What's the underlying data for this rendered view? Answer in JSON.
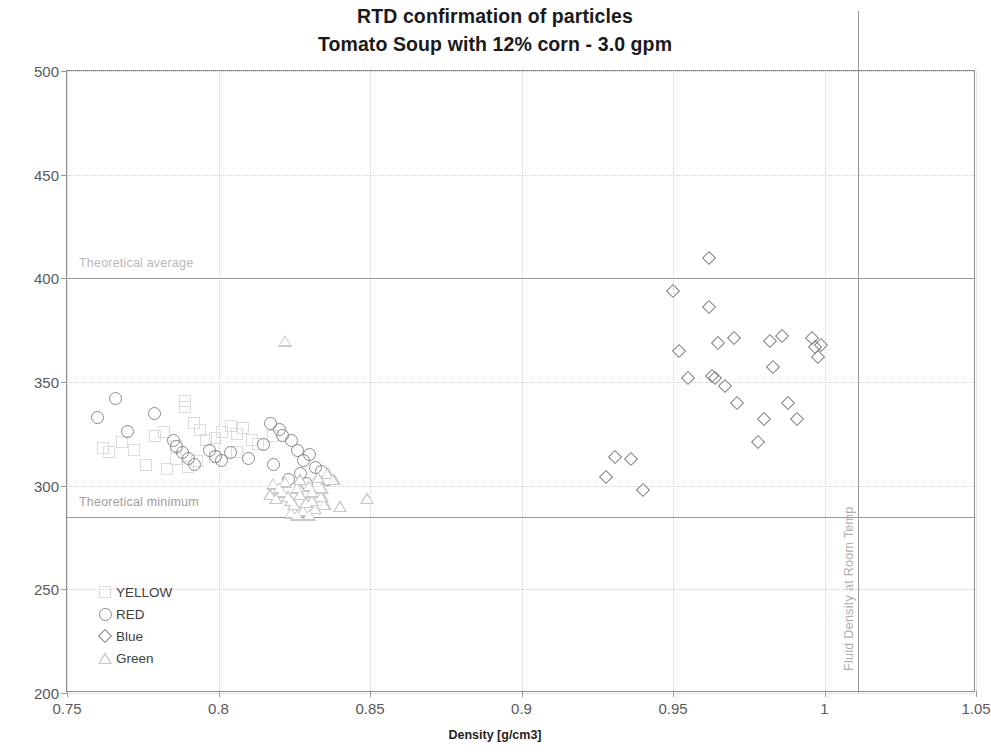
{
  "chart_data": {
    "type": "scatter",
    "title": "RTD confirmation of particles",
    "subtitle": "Tomato Soup with 12% corn -  3.0 gpm",
    "xlabel": "Density [g/cm3]",
    "ylabel": "Residence time in hold tube [s]",
    "xlim": [
      0.75,
      1.05
    ],
    "ylim": [
      200,
      500
    ],
    "xticks": [
      "0.75",
      "0.8",
      "0.85",
      "0.9",
      "0.95",
      "1",
      "1.05"
    ],
    "xtick_values": [
      0.75,
      0.8,
      0.85,
      0.9,
      0.95,
      1.0,
      1.05
    ],
    "yticks": [
      "200",
      "250",
      "300",
      "350",
      "400",
      "450",
      "500"
    ],
    "ytick_values": [
      200,
      250,
      300,
      350,
      400,
      450,
      500
    ],
    "grid": true,
    "legend_position": "lower-left inside plot",
    "annotations": [
      {
        "name": "theoretical-average",
        "text": "Theoretical average",
        "type": "hline",
        "y": 400
      },
      {
        "name": "theoretical-minimum",
        "text": "Theoretical minimum",
        "type": "hline",
        "y": 285
      },
      {
        "name": "fluid-density-room-temp",
        "text": "Fluid Density at Room Temp",
        "type": "vline",
        "x": 1.011
      }
    ],
    "series": [
      {
        "name": "YELLOW",
        "marker": "square",
        "color": "#dcdcdc",
        "points": [
          [
            0.762,
            318
          ],
          [
            0.764,
            316
          ],
          [
            0.768,
            321
          ],
          [
            0.772,
            317
          ],
          [
            0.779,
            324
          ],
          [
            0.782,
            326
          ],
          [
            0.786,
            319
          ],
          [
            0.789,
            341
          ],
          [
            0.789,
            338
          ],
          [
            0.792,
            330
          ],
          [
            0.794,
            327
          ],
          [
            0.796,
            322
          ],
          [
            0.799,
            323
          ],
          [
            0.801,
            326
          ],
          [
            0.804,
            329
          ],
          [
            0.806,
            325
          ],
          [
            0.808,
            328
          ],
          [
            0.811,
            322
          ],
          [
            0.786,
            313
          ],
          [
            0.793,
            312
          ],
          [
            0.799,
            314
          ],
          [
            0.806,
            316
          ],
          [
            0.813,
            320
          ],
          [
            0.818,
            324
          ],
          [
            0.776,
            310
          ],
          [
            0.783,
            308
          ],
          [
            0.79,
            309
          ]
        ]
      },
      {
        "name": "RED",
        "marker": "circle",
        "color": "#8a8a8a",
        "points": [
          [
            0.76,
            333
          ],
          [
            0.766,
            342
          ],
          [
            0.77,
            326
          ],
          [
            0.779,
            335
          ],
          [
            0.785,
            322
          ],
          [
            0.786,
            319
          ],
          [
            0.788,
            316
          ],
          [
            0.79,
            313
          ],
          [
            0.792,
            310
          ],
          [
            0.797,
            317
          ],
          [
            0.799,
            314
          ],
          [
            0.801,
            312
          ],
          [
            0.804,
            316
          ],
          [
            0.81,
            313
          ],
          [
            0.815,
            320
          ],
          [
            0.817,
            330
          ],
          [
            0.82,
            327
          ],
          [
            0.821,
            324
          ],
          [
            0.818,
            310
          ],
          [
            0.824,
            322
          ],
          [
            0.826,
            317
          ],
          [
            0.828,
            312
          ],
          [
            0.83,
            315
          ],
          [
            0.832,
            309
          ],
          [
            0.834,
            307
          ],
          [
            0.836,
            303
          ],
          [
            0.827,
            306
          ],
          [
            0.829,
            301
          ],
          [
            0.823,
            303
          ]
        ]
      },
      {
        "name": "Blue",
        "marker": "diamond",
        "color": "#7d7d7d",
        "points": [
          [
            0.928,
            304
          ],
          [
            0.931,
            314
          ],
          [
            0.936,
            313
          ],
          [
            0.94,
            298
          ],
          [
            0.95,
            394
          ],
          [
            0.952,
            365
          ],
          [
            0.955,
            352
          ],
          [
            0.962,
            410
          ],
          [
            0.962,
            386
          ],
          [
            0.963,
            353
          ],
          [
            0.964,
            352
          ],
          [
            0.965,
            369
          ],
          [
            0.967,
            348
          ],
          [
            0.97,
            371
          ],
          [
            0.971,
            340
          ],
          [
            0.978,
            321
          ],
          [
            0.98,
            332
          ],
          [
            0.982,
            370
          ],
          [
            0.983,
            357
          ],
          [
            0.986,
            372
          ],
          [
            0.988,
            340
          ],
          [
            0.991,
            332
          ],
          [
            0.996,
            371
          ],
          [
            0.997,
            367
          ],
          [
            0.998,
            362
          ],
          [
            0.999,
            368
          ]
        ]
      },
      {
        "name": "Green",
        "marker": "triangle",
        "color": "#c9c9c9",
        "points": [
          [
            0.822,
            370
          ],
          [
            0.818,
            301
          ],
          [
            0.82,
            299
          ],
          [
            0.821,
            297
          ],
          [
            0.822,
            302
          ],
          [
            0.823,
            295
          ],
          [
            0.824,
            293
          ],
          [
            0.825,
            291
          ],
          [
            0.826,
            299
          ],
          [
            0.827,
            296
          ],
          [
            0.828,
            288
          ],
          [
            0.829,
            292
          ],
          [
            0.83,
            300
          ],
          [
            0.831,
            297
          ],
          [
            0.832,
            289
          ],
          [
            0.833,
            304
          ],
          [
            0.834,
            295
          ],
          [
            0.835,
            291
          ],
          [
            0.836,
            306
          ],
          [
            0.838,
            303
          ],
          [
            0.84,
            290
          ],
          [
            0.849,
            294
          ],
          [
            0.824,
            287
          ],
          [
            0.826,
            286
          ],
          [
            0.83,
            286
          ],
          [
            0.834,
            299
          ],
          [
            0.827,
            303
          ],
          [
            0.819,
            294
          ],
          [
            0.817,
            296
          ],
          [
            0.831,
            293
          ]
        ]
      }
    ]
  },
  "legend": {
    "items": [
      {
        "label": "YELLOW",
        "marker": "square"
      },
      {
        "label": "RED",
        "marker": "circle"
      },
      {
        "label": "Blue",
        "marker": "diamond"
      },
      {
        "label": "Green",
        "marker": "triangle"
      }
    ]
  }
}
